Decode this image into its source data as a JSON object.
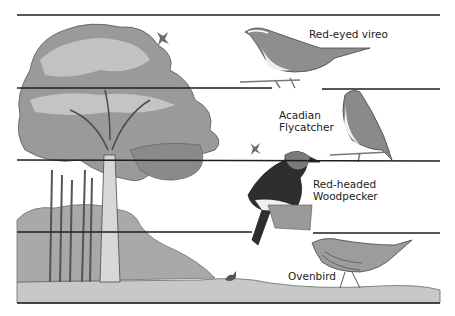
{
  "figure": {
    "style": "grayscale pen-and-wash illustration",
    "strata_lines_y": [
      15,
      88,
      160,
      232,
      303
    ],
    "line_x_range": [
      17,
      440
    ],
    "colors": {
      "line": "#1e1e1e",
      "ink": "#3a3a3a",
      "foliage_dark": "#6a6a6a",
      "foliage_light": "#b4b4b4",
      "ground": "#c6c6c6",
      "text": "#222222"
    }
  },
  "layers": [
    {
      "name": "canopy",
      "bird": "Red-eyed vireo",
      "label": "Red-eyed vireo"
    },
    {
      "name": "subcanopy",
      "bird": "Acadian Flycatcher",
      "label": "Acadian\nFlycatcher"
    },
    {
      "name": "trunk",
      "bird": "Red-headed Woodpecker",
      "label": "Red-headed\nWoodpecker"
    },
    {
      "name": "ground",
      "bird": "Ovenbird",
      "label": "Ovenbird"
    }
  ],
  "scene": {
    "elements": [
      "large-deciduous-tree",
      "understory-shrubs",
      "ground-strip",
      "small-flying-bird",
      "small-flying-bird",
      "small-ground-animal"
    ]
  }
}
